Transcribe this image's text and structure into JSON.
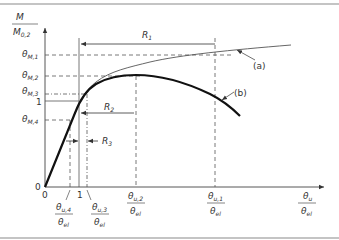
{
  "figure": {
    "y_axis": {
      "label_numerator": "M",
      "label_denominator_main": "M",
      "label_denominator_sub": "0,2",
      "ticks": [
        {
          "id": "theta_M1",
          "main": "θ",
          "sub": "M,1"
        },
        {
          "id": "theta_M2",
          "main": "θ",
          "sub": "M,2"
        },
        {
          "id": "theta_M3",
          "main": "θ",
          "sub": "M,3"
        },
        {
          "id": "one",
          "main": "1",
          "sub": ""
        },
        {
          "id": "theta_M4",
          "main": "θ",
          "sub": "M,4"
        }
      ],
      "origin_label": "0"
    },
    "x_axis": {
      "origin_label": "0",
      "one_label": "1",
      "label_numerator_main": "θ",
      "label_numerator_sub": "u",
      "label_denominator_main": "θ",
      "label_denominator_sub": "el",
      "ticks": [
        {
          "id": "theta_u4",
          "num_main": "θ",
          "num_sub": "u,4",
          "den_main": "θ",
          "den_sub": "el"
        },
        {
          "id": "theta_u3",
          "num_main": "θ",
          "num_sub": "u,3",
          "den_main": "θ",
          "den_sub": "el"
        },
        {
          "id": "theta_u2",
          "num_main": "θ",
          "num_sub": "u,2",
          "den_main": "θ",
          "den_sub": "el"
        },
        {
          "id": "theta_u1",
          "num_main": "θ",
          "num_sub": "u,1",
          "den_main": "θ",
          "den_sub": "el"
        }
      ]
    },
    "ranges": {
      "R1": {
        "main": "R",
        "sub": "1"
      },
      "R2": {
        "main": "R",
        "sub": "2"
      },
      "R3": {
        "main": "R",
        "sub": "3"
      }
    },
    "curves": {
      "a": {
        "label": "(a)",
        "color": "#555555"
      },
      "b": {
        "label": "(b)",
        "color": "#111111"
      }
    },
    "colors": {
      "frame": "#8a8a8a",
      "axis": "#444444",
      "dash": "#555555"
    }
  }
}
